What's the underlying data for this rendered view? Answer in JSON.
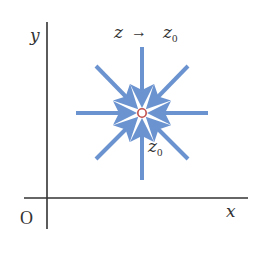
{
  "diagram": {
    "axes": {
      "x_label": "x",
      "y_label": "y",
      "origin_label": "O",
      "axis_color": "#333333"
    },
    "title": {
      "z": "z",
      "arrow": "→",
      "z0_base": "z",
      "z0_sub": "0"
    },
    "point": {
      "label_base": "z",
      "label_sub": "0",
      "stroke_color": "#c0504d"
    },
    "arrows": {
      "color": "#6b93cf",
      "count": 8,
      "directions": [
        "N",
        "NE",
        "E",
        "SE",
        "S",
        "SW",
        "W",
        "NW"
      ],
      "meaning": "converging toward z0"
    }
  }
}
